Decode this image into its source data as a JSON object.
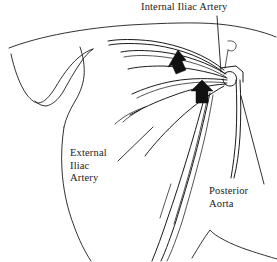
{
  "figure": {
    "type": "anatomical-line-drawing",
    "background_color": "#ffffff",
    "line_color": "#1b1b1b",
    "arrow_color": "#111111"
  },
  "labels": {
    "internal_iliac": {
      "text": "Internal Iliac Artery",
      "lines": [
        "Internal Iliac Artery"
      ]
    },
    "external_iliac": {
      "text": "External Iliac Artery",
      "lines": [
        "External",
        "Iliac",
        "Artery"
      ]
    },
    "posterior_aorta": {
      "text": "Posterior Aorta",
      "lines": [
        "Posterior",
        "Aorta"
      ]
    }
  },
  "markers": {
    "arrow_upper": {
      "name": "block-arrow-upper",
      "points_to": "internal iliac artery branch",
      "direction": "up-right"
    },
    "arrow_lower": {
      "name": "block-arrow-lower",
      "points_to": "iliac artery junction",
      "direction": "up"
    }
  },
  "leaders": {
    "internal_iliac_leader": "vertical line from label down to vessel junction",
    "external_iliac_leader": "diagonal line from label up-right to vessel",
    "posterior_aorta_leader": "diagonal line from label up-left to aorta"
  }
}
